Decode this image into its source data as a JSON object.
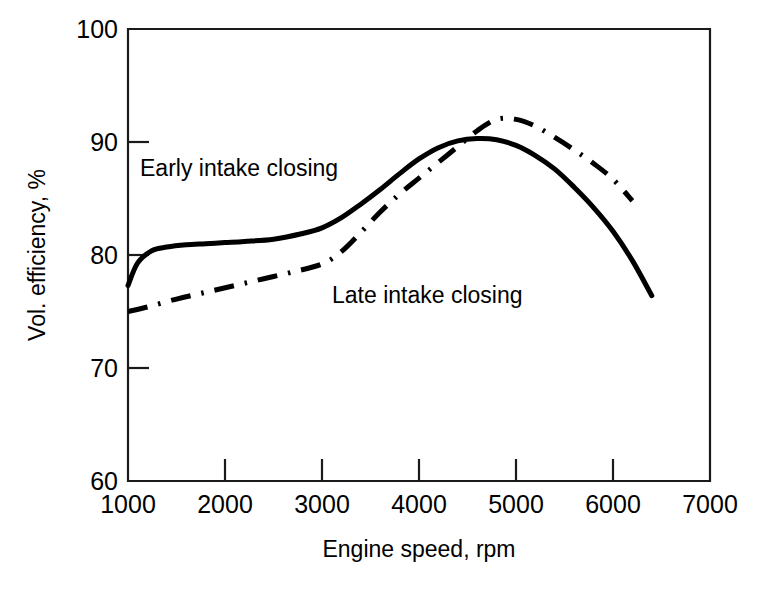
{
  "chart_data": {
    "type": "line",
    "title": "",
    "xlabel": "Engine speed, rpm",
    "ylabel": "Vol. efficiency, %",
    "xlim": [
      1000,
      7000
    ],
    "ylim": [
      60,
      100
    ],
    "xticks": [
      1000,
      2000,
      3000,
      4000,
      5000,
      6000,
      7000
    ],
    "yticks": [
      60,
      70,
      80,
      90,
      100
    ],
    "xtick_labels": [
      "1000",
      "2000",
      "3000",
      "4000",
      "5000",
      "6000",
      "7000"
    ],
    "ytick_labels": [
      "60",
      "70",
      "80",
      "90",
      "100"
    ],
    "grid": false,
    "legend_position": "inline-annotations",
    "series": [
      {
        "name": "Early intake closing",
        "style": "solid",
        "color": "#000000",
        "x": [
          1000,
          1100,
          1250,
          1400,
          1600,
          1800,
          2000,
          2200,
          2500,
          2800,
          3000,
          3200,
          3400,
          3600,
          3800,
          4000,
          4200,
          4400,
          4600,
          4800,
          5000,
          5200,
          5400,
          5600,
          5800,
          6000,
          6200,
          6400
        ],
        "y": [
          77.3,
          79.3,
          80.4,
          80.7,
          80.9,
          81.0,
          81.1,
          81.2,
          81.4,
          81.9,
          82.4,
          83.3,
          84.5,
          85.8,
          87.2,
          88.5,
          89.5,
          90.1,
          90.3,
          90.2,
          89.7,
          88.8,
          87.6,
          86.0,
          84.2,
          82.1,
          79.5,
          76.4
        ]
      },
      {
        "name": "Late intake closing",
        "style": "dash-dot",
        "color": "#000000",
        "x": [
          1000,
          1200,
          1500,
          1800,
          2100,
          2400,
          2700,
          3000,
          3200,
          3400,
          3600,
          3800,
          4000,
          4200,
          4400,
          4600,
          4800,
          5000,
          5200,
          5400,
          5600,
          5800,
          6000,
          6200
        ],
        "y": [
          75.0,
          75.4,
          76.1,
          76.7,
          77.3,
          77.9,
          78.5,
          79.2,
          80.3,
          82.0,
          83.8,
          85.4,
          86.8,
          88.2,
          89.6,
          91.0,
          92.0,
          92.0,
          91.4,
          90.4,
          89.3,
          88.1,
          86.7,
          84.8
        ]
      }
    ],
    "annotations": [
      {
        "text": "Early intake closing",
        "x": 1350,
        "y": 86.8,
        "series": "Early intake closing"
      },
      {
        "text": "Late intake closing",
        "x": 3300,
        "y": 74.6,
        "series": "Late intake closing"
      }
    ]
  }
}
